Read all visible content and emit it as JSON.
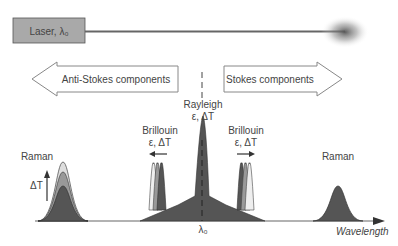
{
  "laser": {
    "label": "Laser, λ₀"
  },
  "arrows": {
    "anti_stokes": "Anti-Stokes components",
    "stokes": "Stokes components"
  },
  "peaks": {
    "raman_left": "Raman",
    "raman_right": "Raman",
    "brillouin_left": "Brillouin",
    "brillouin_right": "Brillouin",
    "brillouin_left_params": "ε, ΔT",
    "brillouin_right_params": "ε, ΔT",
    "rayleigh": "Rayleigh",
    "rayleigh_params": "ε, ΔT",
    "delta_t": "ΔT"
  },
  "axis": {
    "center_label": "λ₀",
    "x_label": "Wavelength"
  },
  "colors": {
    "dark_fill": "#555555",
    "mid_fill": "#8a8a8a",
    "light_fill": "#d8d8d8",
    "laser_box": "#a9a9a9",
    "outline": "#333333"
  }
}
